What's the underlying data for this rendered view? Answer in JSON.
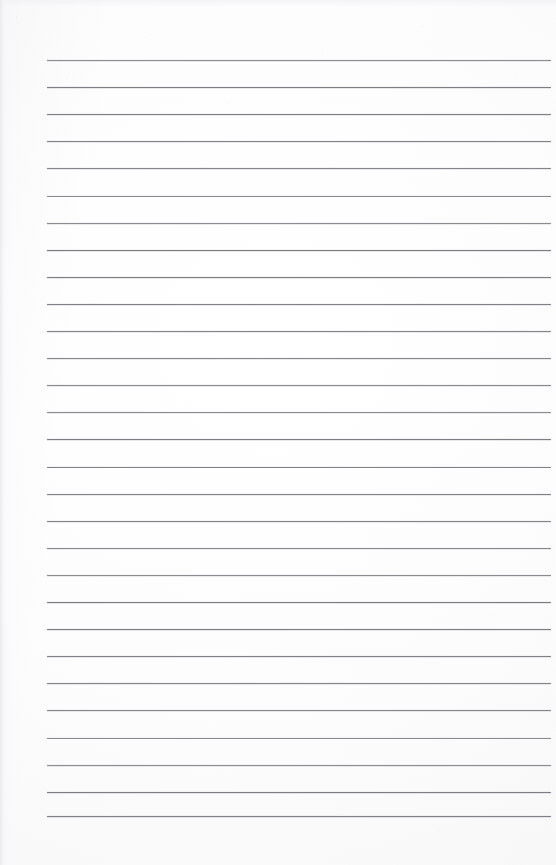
{
  "document": {
    "kind": "scanned-ruled-paper",
    "title": "Blank ruled notebook page",
    "page_width": 556,
    "page_height": 865,
    "has_text_content": false,
    "has_header": false,
    "has_footer": false,
    "has_page_number": false,
    "has_margin_rule": false,
    "background_color": "#fefefe",
    "paper_tone": "#f7f7f8"
  },
  "ruling": {
    "line_color": "#74747b",
    "line_thickness_px": 1,
    "line_count": 29,
    "left_x": 47,
    "right_x": 551,
    "line_length": 504,
    "first_line_y": 60,
    "spacing_px": 27.1,
    "lines_y": [
      60,
      87.1,
      114.2,
      141.3,
      168.4,
      195.5,
      222.6,
      249.7,
      276.8,
      303.9,
      331.0,
      358.1,
      385.2,
      412.3,
      439.4,
      466.5,
      493.6,
      520.7,
      547.8,
      574.9,
      602.0,
      629.1,
      656.2,
      683.3,
      710.4,
      737.5,
      764.6,
      791.7,
      816.0
    ]
  },
  "margins": {
    "top_margin_px": 60,
    "left_margin_px": 47,
    "right_margin_px": 5,
    "bottom_margin_px": 49
  }
}
